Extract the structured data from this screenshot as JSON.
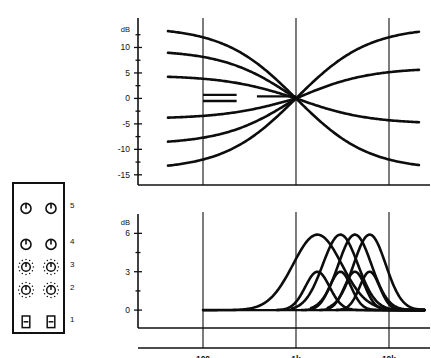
{
  "panel": {
    "name": "equalizer-control-panel",
    "row_numbers": [
      "5",
      "4",
      "3",
      "2",
      "1"
    ],
    "rows": [
      {
        "number": "5",
        "control_type": "rotary-knob",
        "count": 2,
        "ticks": false
      },
      {
        "number": "4",
        "control_type": "rotary-knob",
        "count": 2,
        "ticks": false
      },
      {
        "number": "3",
        "control_type": "rotary-knob-detented",
        "count": 2,
        "ticks": true
      },
      {
        "number": "2",
        "control_type": "rotary-knob-detented",
        "count": 2,
        "ticks": true
      },
      {
        "number": "1",
        "control_type": "push-button-switch",
        "count": 2,
        "ticks": false
      }
    ]
  },
  "chart_data": [
    {
      "id": "shelving-response",
      "type": "line",
      "title": "",
      "xlabel": "",
      "ylabel": "dB",
      "yunit": "dB",
      "x_scale": "log",
      "x_ticks": [
        {
          "label": "100",
          "value": 100
        },
        {
          "label": "1k",
          "value": 1000
        },
        {
          "label": "10k",
          "value": 10000
        }
      ],
      "x_tick_labels": [
        "100",
        "1k",
        "10k"
      ],
      "y_ticks": [
        10,
        5,
        0,
        -5,
        -10,
        -15
      ],
      "y_tick_labels": [
        "10",
        "5",
        "0",
        "-5",
        "-10",
        "-15"
      ],
      "ylim": [
        -17,
        15
      ],
      "xlim": [
        20,
        25000
      ],
      "grid": true,
      "legend": null,
      "series": [
        {
          "name": "low-shelf-boost-max",
          "end_db": 14.0,
          "hinge_hz": 1000,
          "side": "low"
        },
        {
          "name": "low-shelf-boost-mid",
          "end_db": 9.5,
          "hinge_hz": 1000,
          "side": "low"
        },
        {
          "name": "low-shelf-boost-min",
          "end_db": 4.5,
          "hinge_hz": 1000,
          "side": "low"
        },
        {
          "name": "low-shelf-cut-min",
          "end_db": -4.0,
          "hinge_hz": 1000,
          "side": "low"
        },
        {
          "name": "low-shelf-cut-mid",
          "end_db": -9.0,
          "hinge_hz": 1000,
          "side": "low"
        },
        {
          "name": "low-shelf-cut-max",
          "end_db": -14.0,
          "hinge_hz": 1000,
          "side": "low"
        },
        {
          "name": "high-shelf-boost-max",
          "end_db": 14.0,
          "hinge_hz": 1000,
          "side": "high"
        },
        {
          "name": "high-shelf-boost-mid",
          "end_db": 6.0,
          "hinge_hz": 1000,
          "side": "high"
        },
        {
          "name": "high-shelf-cut-mid",
          "end_db": -5.0,
          "hinge_hz": 1000,
          "side": "high"
        },
        {
          "name": "high-shelf-cut-max",
          "end_db": -14.0,
          "hinge_hz": 1000,
          "side": "high"
        }
      ],
      "flat_segments": [
        {
          "name": "flat-0db-left",
          "db": 0.7,
          "from_hz": 100,
          "to_hz": 230
        },
        {
          "name": "flat-0db-left2",
          "db": -0.5,
          "from_hz": 100,
          "to_hz": 230
        },
        {
          "name": "flat-0db-mid",
          "db": 0.4,
          "from_hz": 380,
          "to_hz": 1000
        }
      ]
    },
    {
      "id": "peaking-response",
      "type": "line",
      "title": "",
      "xlabel": "",
      "ylabel": "dB",
      "yunit": "dB",
      "x_scale": "log",
      "x_ticks": [
        {
          "label": "100",
          "value": 100
        },
        {
          "label": "1k",
          "value": 1000
        },
        {
          "label": "10k",
          "value": 10000
        }
      ],
      "x_tick_labels": [
        "100",
        "1k",
        "10k"
      ],
      "y_ticks": [
        6,
        3,
        0
      ],
      "y_tick_labels": [
        "6",
        "3",
        "0"
      ],
      "ylim": [
        -1.4,
        7.2
      ],
      "xlim": [
        20,
        25000
      ],
      "grid": true,
      "legend": null,
      "series": [
        {
          "name": "peak-1-wide",
          "center_hz": 1700,
          "gain_db": 5.9,
          "q": 1.15,
          "start_hz": 100
        },
        {
          "name": "peak-2-narrow",
          "center_hz": 1700,
          "gain_db": 3.0,
          "q": 2.3,
          "start_hz": 620
        },
        {
          "name": "peak-3-wide",
          "center_hz": 3000,
          "gain_db": 5.9,
          "q": 1.6,
          "start_hz": 900
        },
        {
          "name": "peak-4-narrow",
          "center_hz": 3000,
          "gain_db": 3.0,
          "q": 2.6,
          "start_hz": 1150
        },
        {
          "name": "peak-5-wide",
          "center_hz": 4300,
          "gain_db": 5.9,
          "q": 1.7,
          "start_hz": 1450
        },
        {
          "name": "peak-6-narrow",
          "center_hz": 4300,
          "gain_db": 3.0,
          "q": 2.7,
          "start_hz": 1800
        },
        {
          "name": "peak-7-wide",
          "center_hz": 6200,
          "gain_db": 5.9,
          "q": 1.75,
          "start_hz": 2200
        },
        {
          "name": "peak-8-narrow",
          "center_hz": 6200,
          "gain_db": 3.0,
          "q": 2.8,
          "start_hz": 2700
        }
      ],
      "baseline": {
        "name": "zero-db-baseline",
        "db": 0,
        "from_hz": 100,
        "to_hz": 25000
      }
    }
  ],
  "colors": {
    "ink": "#111111",
    "curve": "#0d0d0d",
    "background": "#ffffff"
  }
}
